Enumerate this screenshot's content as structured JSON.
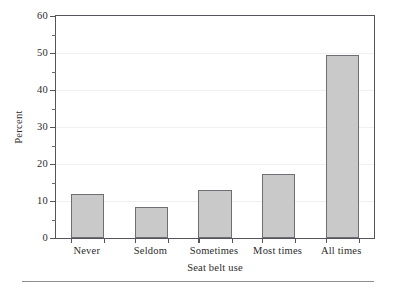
{
  "chart_data": {
    "type": "bar",
    "title": "",
    "subtitle": "",
    "xlabel": "Seat belt use",
    "ylabel": "Percent",
    "categories": [
      "Never",
      "Seldom",
      "Sometimes",
      "Most times",
      "All times"
    ],
    "values": [
      11.8,
      8.5,
      13.0,
      17.2,
      49.5
    ],
    "series": [
      {
        "name": "Percent",
        "values": [
          11.8,
          8.5,
          13.0,
          17.2,
          49.5
        ]
      }
    ],
    "ylim": [
      0,
      60
    ],
    "xlim_categories": 5,
    "y_major_ticks": [
      0,
      10,
      20,
      30,
      40,
      50,
      60
    ],
    "y_tick_labels": [
      "0",
      "10",
      "20",
      "30",
      "40",
      "50",
      "60"
    ],
    "y_minor_ticks": [
      5,
      15,
      25,
      35,
      45,
      55
    ],
    "grid": "horizontal-faint",
    "legend": "none",
    "bar_fill_color": "#c9c9c9",
    "bar_edge_color": "#6e6e76",
    "axis_color": "#54545c",
    "text_color": "#2b2b2b"
  },
  "figure": {
    "bottom_rule_color": "#8d8d96"
  }
}
